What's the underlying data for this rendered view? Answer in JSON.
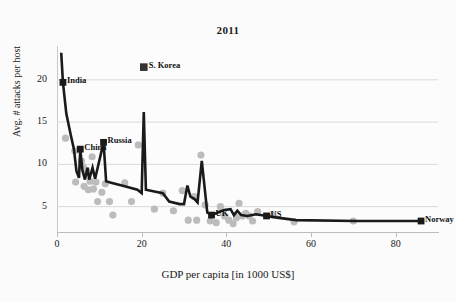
{
  "chart_data": {
    "type": "scatter",
    "title": "2011",
    "xlabel": "GDP per capita [in 1000 US$]",
    "ylabel": "Avg. # attacks per host",
    "xlim": [
      0,
      90
    ],
    "ylim": [
      2,
      24
    ],
    "xticks": [
      0,
      20,
      40,
      60,
      80
    ],
    "yticks": [
      5,
      10,
      15,
      20
    ],
    "grid": true,
    "legend": "none",
    "series": [
      {
        "name": "line-series",
        "style": "line-with-square-markers",
        "color": "#1a1a1a",
        "points": [
          {
            "x": 1.0,
            "y": 23.2
          },
          {
            "x": 1.4,
            "y": 19.7,
            "label": "India"
          },
          {
            "x": 2.2,
            "y": 16.0
          },
          {
            "x": 3.2,
            "y": 13.6
          },
          {
            "x": 4.0,
            "y": 11.8
          },
          {
            "x": 4.6,
            "y": 9.2
          },
          {
            "x": 5.2,
            "y": 8.4
          },
          {
            "x": 5.5,
            "y": 11.8,
            "label": "China"
          },
          {
            "x": 6.0,
            "y": 9.3
          },
          {
            "x": 6.6,
            "y": 8.2
          },
          {
            "x": 7.2,
            "y": 9.6
          },
          {
            "x": 7.6,
            "y": 8.2
          },
          {
            "x": 8.4,
            "y": 9.6
          },
          {
            "x": 9.0,
            "y": 8.3
          },
          {
            "x": 11.0,
            "y": 12.6,
            "label": "Russia"
          },
          {
            "x": 11.6,
            "y": 8.0
          },
          {
            "x": 13.0,
            "y": 7.8
          },
          {
            "x": 16.0,
            "y": 7.4
          },
          {
            "x": 19.0,
            "y": 7.0
          },
          {
            "x": 20.0,
            "y": 6.6
          },
          {
            "x": 20.5,
            "y": 16.2
          },
          {
            "x": 21.0,
            "y": 7.0
          },
          {
            "x": 23.0,
            "y": 6.8
          },
          {
            "x": 25.0,
            "y": 6.6
          },
          {
            "x": 26.5,
            "y": 5.6
          },
          {
            "x": 29.0,
            "y": 5.3
          },
          {
            "x": 30.0,
            "y": 5.3
          },
          {
            "x": 30.8,
            "y": 7.5
          },
          {
            "x": 31.5,
            "y": 6.2
          },
          {
            "x": 32.5,
            "y": 5.9
          },
          {
            "x": 33.2,
            "y": 5.5
          },
          {
            "x": 34.2,
            "y": 10.4
          },
          {
            "x": 35.5,
            "y": 4.3
          },
          {
            "x": 36.5,
            "y": 4.0,
            "label": "UK"
          },
          {
            "x": 38.0,
            "y": 4.3
          },
          {
            "x": 39.5,
            "y": 4.6
          },
          {
            "x": 41.0,
            "y": 4.7
          },
          {
            "x": 41.8,
            "y": 4.0
          },
          {
            "x": 42.6,
            "y": 4.5
          },
          {
            "x": 43.5,
            "y": 4.0
          },
          {
            "x": 45.0,
            "y": 3.9
          },
          {
            "x": 47.0,
            "y": 4.1
          },
          {
            "x": 49.5,
            "y": 3.9,
            "label": "US"
          },
          {
            "x": 52.0,
            "y": 3.7
          },
          {
            "x": 56.5,
            "y": 3.4
          },
          {
            "x": 70.5,
            "y": 3.3
          },
          {
            "x": 86.0,
            "y": 3.3,
            "label": "Norway"
          }
        ]
      },
      {
        "name": "scatter-series",
        "style": "gray-dots",
        "color": "#bcbcbc",
        "points": [
          {
            "x": 2.0,
            "y": 13.1
          },
          {
            "x": 4.2,
            "y": 11.6
          },
          {
            "x": 4.4,
            "y": 7.9
          },
          {
            "x": 5.8,
            "y": 10.4
          },
          {
            "x": 6.2,
            "y": 9.7
          },
          {
            "x": 6.4,
            "y": 7.4
          },
          {
            "x": 7.0,
            "y": 9.3
          },
          {
            "x": 7.4,
            "y": 7.0
          },
          {
            "x": 7.8,
            "y": 8.0
          },
          {
            "x": 8.3,
            "y": 10.9
          },
          {
            "x": 8.6,
            "y": 7.1
          },
          {
            "x": 9.2,
            "y": 7.9
          },
          {
            "x": 9.6,
            "y": 5.6
          },
          {
            "x": 10.6,
            "y": 6.7
          },
          {
            "x": 11.4,
            "y": 7.7
          },
          {
            "x": 12.4,
            "y": 5.6
          },
          {
            "x": 13.2,
            "y": 4.0
          },
          {
            "x": 16.0,
            "y": 7.8
          },
          {
            "x": 17.6,
            "y": 5.6
          },
          {
            "x": 19.2,
            "y": 12.3
          },
          {
            "x": 23.0,
            "y": 4.7
          },
          {
            "x": 25.0,
            "y": 6.6
          },
          {
            "x": 27.5,
            "y": 4.5
          },
          {
            "x": 29.6,
            "y": 6.9
          },
          {
            "x": 31.0,
            "y": 3.4
          },
          {
            "x": 32.4,
            "y": 6.2
          },
          {
            "x": 33.0,
            "y": 3.4
          },
          {
            "x": 34.0,
            "y": 11.1
          },
          {
            "x": 35.0,
            "y": 5.2
          },
          {
            "x": 36.2,
            "y": 3.3
          },
          {
            "x": 37.6,
            "y": 3.1
          },
          {
            "x": 38.6,
            "y": 5.0
          },
          {
            "x": 39.6,
            "y": 3.9
          },
          {
            "x": 40.6,
            "y": 3.4
          },
          {
            "x": 41.6,
            "y": 3.0
          },
          {
            "x": 42.4,
            "y": 3.7
          },
          {
            "x": 43.0,
            "y": 5.4
          },
          {
            "x": 43.8,
            "y": 3.9
          },
          {
            "x": 44.6,
            "y": 4.2
          },
          {
            "x": 45.4,
            "y": 3.9
          },
          {
            "x": 46.2,
            "y": 3.3
          },
          {
            "x": 47.4,
            "y": 4.4
          },
          {
            "x": 51.0,
            "y": 4.0
          },
          {
            "x": 56.0,
            "y": 3.2
          },
          {
            "x": 70.0,
            "y": 3.3
          }
        ]
      },
      {
        "name": "isolated-marker",
        "style": "square-marker",
        "color": "#333333",
        "points": [
          {
            "x": 20.5,
            "y": 21.5,
            "label": "S. Korea"
          }
        ]
      }
    ],
    "annotations": [
      "India",
      "China",
      "Russia",
      "S. Korea",
      "UK",
      "US",
      "Norway"
    ]
  }
}
